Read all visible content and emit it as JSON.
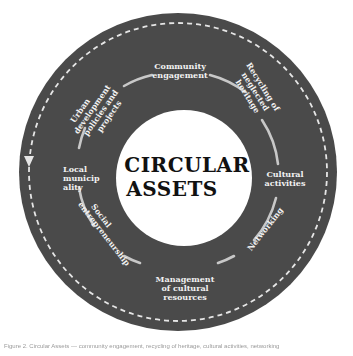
{
  "diagram": {
    "center_title_lines": [
      "CIRCULAR",
      "ASSETS"
    ],
    "colors": {
      "ring": "#4a4a4a",
      "inner_arc": "#c8c8c8",
      "dashes": "#e6e6e6",
      "center_fill": "#ffffff",
      "title": "#111111",
      "label": "#f2f2f2"
    },
    "cycle_direction": "counter-clockwise",
    "nodes": [
      {
        "id": "community-engagement",
        "lines": [
          "Community",
          "engagement"
        ]
      },
      {
        "id": "recycling-of-neglected-heritage",
        "lines": [
          "Recycling of",
          "neglected",
          "heritage"
        ]
      },
      {
        "id": "cultural-activities",
        "lines": [
          "Cultural",
          "activities"
        ]
      },
      {
        "id": "networking",
        "lines": [
          "Networking"
        ]
      },
      {
        "id": "management-of-cultural-resources",
        "lines": [
          "Management",
          "of cultural",
          "resources"
        ]
      },
      {
        "id": "social-entrepreneurship",
        "lines": [
          "Social",
          "entrepreneurship"
        ]
      },
      {
        "id": "local-municipality",
        "lines": [
          "Local",
          "municip",
          "ality"
        ]
      },
      {
        "id": "urban-development-policies-and-projects",
        "lines": [
          "Urban",
          "development",
          "policies and",
          "projects"
        ]
      }
    ]
  },
  "caption": "Figure 2. Circular Assets — community engagement, recycling of heritage, cultural activities, networking"
}
